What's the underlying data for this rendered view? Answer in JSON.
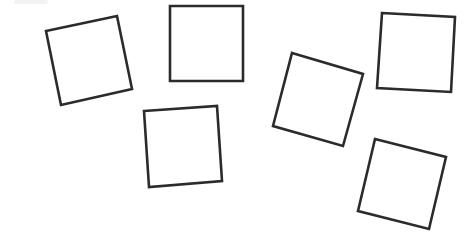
{
  "canvas": {
    "width": 474,
    "height": 249,
    "background": "#ffffff"
  },
  "style": {
    "stroke": "#2b2b2b",
    "stroke_width": 2.6,
    "fill": "#ffffff"
  },
  "squares": [
    {
      "id": "square-1",
      "points": "46,31 117,16 132,89 61,105"
    },
    {
      "id": "square-2",
      "points": "170,6 243,6 243,81 170,81"
    },
    {
      "id": "square-3",
      "points": "144,111 217,106 222,181 149,187"
    },
    {
      "id": "square-4",
      "points": "292,53 363,74 343,146 273,126"
    },
    {
      "id": "square-5",
      "points": "382,13 455,17 451,92 377,88"
    },
    {
      "id": "square-6",
      "points": "375,139 446,157 429,229 358,211"
    }
  ]
}
